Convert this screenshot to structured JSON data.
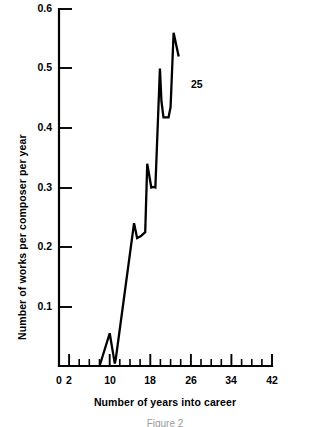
{
  "chart_data": {
    "type": "line",
    "title": "",
    "xlabel": "Number of years into career",
    "ylabel": "Number of works per composer per year",
    "xlim": [
      0,
      42
    ],
    "ylim": [
      0,
      0.6
    ],
    "grid": false,
    "legend": null,
    "x_ticks_major": [
      0,
      2,
      10,
      18,
      26,
      34,
      42
    ],
    "x_tick_labels": [
      "0",
      "2",
      "10",
      "18",
      "26",
      "34",
      "42"
    ],
    "x_ticks_minor": [
      4,
      6,
      8,
      12,
      14,
      16,
      20,
      22,
      24,
      28,
      30,
      32,
      36,
      38,
      40
    ],
    "y_ticks": [
      0.1,
      0.2,
      0.3,
      0.4,
      0.5,
      0.6
    ],
    "y_tick_labels": [
      "0.1",
      "0.2",
      "0.3",
      "0.4",
      "0.5",
      "0.6"
    ],
    "annotations": [
      {
        "text": "25",
        "x": 25,
        "y": 0.472
      }
    ],
    "series": [
      {
        "name": "works per composer per year",
        "x": [
          8.0,
          10.0,
          11.0,
          11.2,
          14.8,
          15.4,
          16.1,
          17.0,
          17.4,
          18.2,
          18.6,
          19.0,
          19.9,
          20.2,
          20.6,
          21.6,
          22.0,
          22.6,
          23.6
        ],
        "y": [
          0.0,
          0.055,
          0.004,
          0.012,
          0.24,
          0.215,
          0.218,
          0.225,
          0.34,
          0.3,
          0.301,
          0.3,
          0.5,
          0.445,
          0.418,
          0.418,
          0.435,
          0.56,
          0.52
        ]
      }
    ]
  },
  "caption": "Figure 2"
}
